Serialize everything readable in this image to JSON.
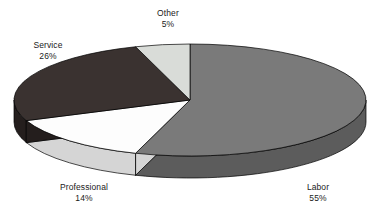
{
  "chart_data": {
    "type": "pie",
    "title": "",
    "subtitle": "",
    "xlabel": "",
    "ylabel": "",
    "legend_position": "none",
    "grid": false,
    "three_d": true,
    "start_angle_deg": 0,
    "direction": "clockwise",
    "categories": [
      "Labor",
      "Professional",
      "Service",
      "Other"
    ],
    "values": [
      55,
      14,
      26,
      5
    ],
    "value_suffix": "%",
    "total": 100,
    "slices": [
      {
        "label": "Labor",
        "value": 55,
        "value_text": "55%",
        "top_color": "#7a7a7a",
        "side_color": "#5c5c5c"
      },
      {
        "label": "Professional",
        "value": 14,
        "value_text": "14%",
        "top_color": "#fdfdfd",
        "side_color": "#d5d5d5"
      },
      {
        "label": "Service",
        "value": 26,
        "value_text": "26%",
        "top_color": "#3a3230",
        "side_color": "#241e1d"
      },
      {
        "label": "Other",
        "value": 5,
        "value_text": "5%",
        "top_color": "#d9dcd8",
        "side_color": "#b6b9b5"
      }
    ]
  },
  "labels": {
    "other": {
      "name": "Other",
      "value": "5%"
    },
    "service": {
      "name": "Service",
      "value": "26%"
    },
    "professional": {
      "name": "Professional",
      "value": "14%"
    },
    "labor": {
      "name": "Labor",
      "value": "55%"
    }
  },
  "caption": {
    "text": ""
  },
  "colors": {
    "background": "#ffffff",
    "text": "#1a1a1a",
    "outline": "#000000"
  }
}
